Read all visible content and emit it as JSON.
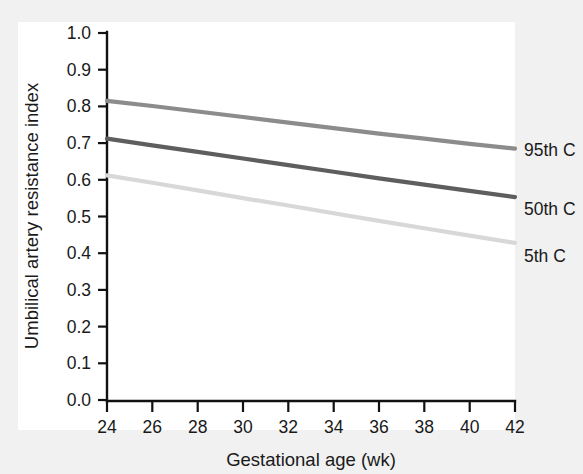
{
  "figure": {
    "background_color": "#f1f1f1",
    "plot_background_color": "#ffffff",
    "axis_color": "#111111"
  },
  "chart_data": {
    "type": "line",
    "title": "",
    "subtitle": "",
    "xlabel": "Gestational age (wk)",
    "ylabel": "Umbilical artery resistance index",
    "xlim": [
      24,
      42
    ],
    "ylim": [
      0.0,
      1.0
    ],
    "xticks": [
      24,
      26,
      28,
      30,
      32,
      34,
      36,
      38,
      40,
      42
    ],
    "xtick_labels": [
      "24",
      "26",
      "28",
      "30",
      "32",
      "34",
      "36",
      "38",
      "40",
      "42"
    ],
    "yticks": [
      0.0,
      0.1,
      0.2,
      0.3,
      0.4,
      0.5,
      0.6,
      0.7,
      0.8,
      0.9,
      1.0
    ],
    "ytick_labels": [
      "0.0",
      "0.1",
      "0.2",
      "0.3",
      "0.4",
      "0.5",
      "0.6",
      "0.7",
      "0.8",
      "0.9",
      "1.0"
    ],
    "grid": false,
    "legend_position": "right-inline-labels",
    "x": [
      24,
      26,
      28,
      30,
      32,
      34,
      36,
      38,
      40,
      42
    ],
    "series": [
      {
        "name": "95th C",
        "color": "#8c8c8c",
        "values": [
          0.815,
          0.801,
          0.786,
          0.771,
          0.756,
          0.741,
          0.726,
          0.712,
          0.698,
          0.685
        ]
      },
      {
        "name": "50th C",
        "color": "#5e5e5e",
        "values": [
          0.712,
          0.694,
          0.676,
          0.658,
          0.64,
          0.622,
          0.604,
          0.587,
          0.57,
          0.553
        ]
      },
      {
        "name": "5th C",
        "color": "#d8d8d8",
        "values": [
          0.612,
          0.592,
          0.571,
          0.55,
          0.53,
          0.509,
          0.488,
          0.468,
          0.448,
          0.428
        ]
      }
    ]
  },
  "labels": {
    "series_95": "95th C",
    "series_50": "50th C",
    "series_5": "5th C"
  }
}
